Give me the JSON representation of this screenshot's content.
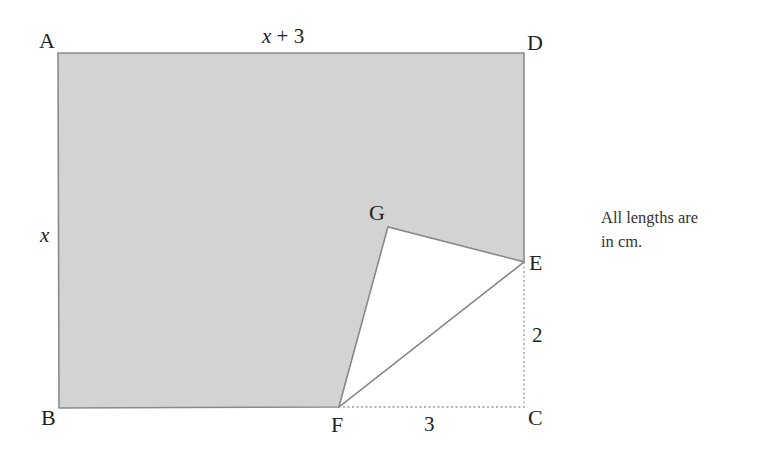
{
  "figure": {
    "type": "geometry-diagram",
    "colors": {
      "shaded_fill": "#d3d3d3",
      "outline": "#8a8a8a",
      "dotted_line": "#9a9a9a",
      "text": "#222222"
    },
    "vertices": {
      "A": {
        "label": "A",
        "x": 58,
        "y": 53
      },
      "B": {
        "label": "B",
        "x": 59,
        "y": 408
      },
      "C": {
        "label": "C",
        "x": 524,
        "y": 407
      },
      "D": {
        "label": "D",
        "x": 524,
        "y": 53
      },
      "E": {
        "label": "E",
        "x": 524,
        "y": 262
      },
      "F": {
        "label": "F",
        "x": 339,
        "y": 407
      },
      "G": {
        "label": "G",
        "x": 388,
        "y": 227
      }
    },
    "dimensions": {
      "top": "x + 3",
      "top_var": "x",
      "top_rest": " + 3",
      "left": "x",
      "EC": "2",
      "FC": "3"
    },
    "note": {
      "line1": "All lengths are",
      "line2": "in cm."
    }
  }
}
